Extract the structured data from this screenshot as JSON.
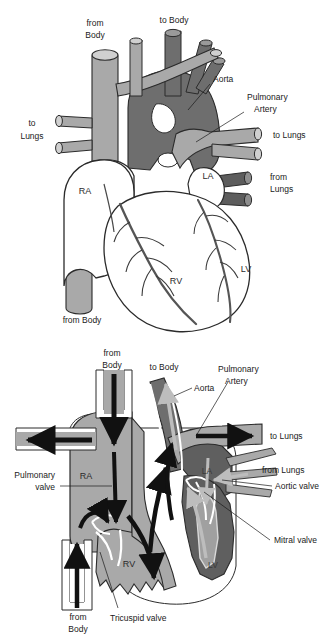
{
  "figure": {
    "panels": [
      {
        "id": "exterior",
        "name": "Heart exterior with great vessels",
        "labels": {
          "from_body_top": "from\nBody",
          "from_body_top_line1": "from",
          "from_body_top_line2": "Body",
          "to_body": "to Body",
          "aorta": "Aorta",
          "pulmonary_artery_line1": "Pulmonary",
          "pulmonary_artery_line2": "Artery",
          "to_lungs_left_line1": "to",
          "to_lungs_left_line2": "Lungs",
          "to_lungs_right": "to Lungs",
          "from_lungs_line1": "from",
          "from_lungs_line2": "Lungs",
          "right_atrium": "RA",
          "left_atrium": "LA",
          "right_ventricle": "RV",
          "left_ventricle": "LV",
          "from_body_bottom": "from Body"
        }
      },
      {
        "id": "crosssection",
        "name": "Heart cross-section showing chambers, valves and blood flow",
        "labels": {
          "from_body_top_line1": "from",
          "from_body_top_line2": "Body",
          "to_body": "to Body",
          "aorta": "Aorta",
          "pulmonary_artery_line1": "Pulmonary",
          "pulmonary_artery_line2": "Artery",
          "to_lungs_right": "to Lungs",
          "from_lungs": "from Lungs",
          "pulmonary_valve_line1": "Pulmonary",
          "pulmonary_valve_line2": "valve",
          "aortic_valve": "Aortic valve",
          "mitral_valve": "Mitral valve",
          "tricuspid_valve": "Tricuspid valve",
          "right_atrium": "RA",
          "left_atrium": "LA",
          "right_ventricle": "RV",
          "left_ventricle": "LV",
          "from_body_bottom_line1": "from",
          "from_body_bottom_line2": "Body"
        }
      }
    ],
    "colors": {
      "oxygenated_dark": "#6e6e6e",
      "deoxygenated_light": "#a9a9a9",
      "muscle_white": "#ffffff",
      "outline": "#2b2b2b",
      "coronary_vessel": "#555555",
      "flow_arrow_dark": "#111111",
      "flow_arrow_light": "#b8b8b8",
      "background": "#ffffff",
      "text": "#1a1a1a"
    }
  }
}
